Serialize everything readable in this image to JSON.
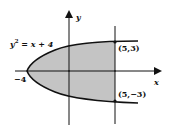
{
  "diagram": {
    "equation_label": "y",
    "equation_exp": "2",
    "equation_rest": " = x + 4",
    "vertex_label": "−4",
    "point_top_label": "(5,3)",
    "point_bottom_label": "(5,−3)",
    "x_axis_label": "x",
    "y_axis_label": "y",
    "colors": {
      "shade": "#c4c4c4",
      "stroke": "#111111",
      "background": "#ffffff"
    }
  }
}
